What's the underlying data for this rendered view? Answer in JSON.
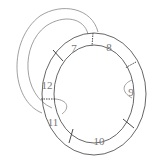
{
  "diagram": {
    "type": "segmented-ring",
    "segments": [
      {
        "label": "7",
        "x": 74,
        "y": 52
      },
      {
        "label": "8",
        "x": 109,
        "y": 51
      },
      {
        "label": "9",
        "x": 131,
        "y": 96
      },
      {
        "label": "10",
        "x": 99,
        "y": 145
      },
      {
        "label": "11",
        "x": 53,
        "y": 126
      },
      {
        "label": "12",
        "x": 47,
        "y": 89
      }
    ],
    "colors": {
      "stroke": "#555555",
      "background": "#ffffff",
      "label": "#777777"
    }
  }
}
